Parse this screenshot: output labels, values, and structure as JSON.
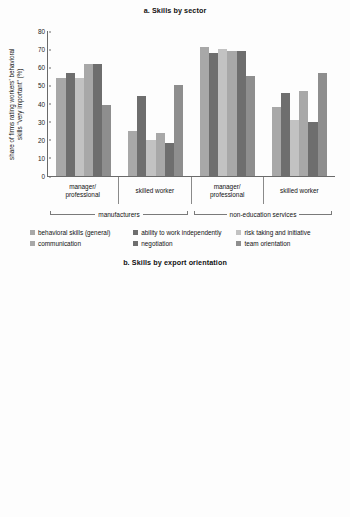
{
  "chart_data": [
    {
      "type": "bar",
      "title": "a. Skills by sector",
      "ylabel": "share of firms rating workers' behavioral\nskills \"very important\" (%)",
      "xlabel": "",
      "ylim": [
        0,
        80
      ],
      "yticks": [
        0,
        10,
        20,
        30,
        40,
        50,
        60,
        70,
        80
      ],
      "grid": false,
      "legend_position": "bottom",
      "categories": [
        "manager/\nprofessional",
        "skilled worker",
        "manager/\nprofessional",
        "skilled worker"
      ],
      "supercategories": [
        "manufacturers",
        "non-education services"
      ],
      "series": [
        {
          "name": "behavioral skills (general)",
          "color": "#a8a8a8",
          "values": [
            54,
            25,
            71,
            38
          ]
        },
        {
          "name": "ability to work independently",
          "color": "#6e6e6e",
          "values": [
            57,
            44,
            68,
            46
          ]
        },
        {
          "name": "risk taking and initiative",
          "color": "#c2c2c2",
          "values": [
            54,
            20,
            70,
            31
          ]
        },
        {
          "name": "communication",
          "color": "#a8a8a8",
          "values": [
            62,
            24,
            69,
            47
          ]
        },
        {
          "name": "negotiation",
          "color": "#6e6e6e",
          "values": [
            62,
            18,
            69,
            30
          ]
        },
        {
          "name": "team orientation",
          "color": "#8e8e8e",
          "values": [
            39,
            50,
            55,
            57
          ]
        }
      ]
    },
    {
      "type": "bar",
      "title": "b. Skills by export orientation",
      "ylabel": "share of firms rating workers' skills\n\"very important\" (%)",
      "xlabel": "",
      "ylim": [
        0,
        100
      ],
      "yticks": [
        0,
        10,
        20,
        30,
        40,
        50,
        60,
        70,
        80,
        90,
        100
      ],
      "grid": false,
      "legend_position": "bottom",
      "categories": [
        "nonexporter",
        "exporter",
        "nonexporter",
        "exporter"
      ],
      "supercategories": [
        "manager/professional",
        "skilled worker"
      ],
      "series": [
        {
          "name": "basic skills (math and literacy)",
          "color": "#b4b4b4",
          "values": [
            52,
            71,
            43,
            72
          ]
        },
        {
          "name": "thinking skills",
          "color": "#6e6e6e",
          "values": [
            66,
            93,
            28,
            50
          ]
        },
        {
          "name": "behavioral skills",
          "color": "#c2c2c2",
          "values": [
            60,
            84,
            28,
            51
          ]
        },
        {
          "name": "computer skills",
          "color": "#a8a8a8",
          "values": [
            28,
            56,
            22,
            34
          ]
        },
        {
          "name": "English skills",
          "color": "#6e6e6e",
          "values": [
            27,
            61,
            9,
            22
          ]
        }
      ]
    }
  ]
}
